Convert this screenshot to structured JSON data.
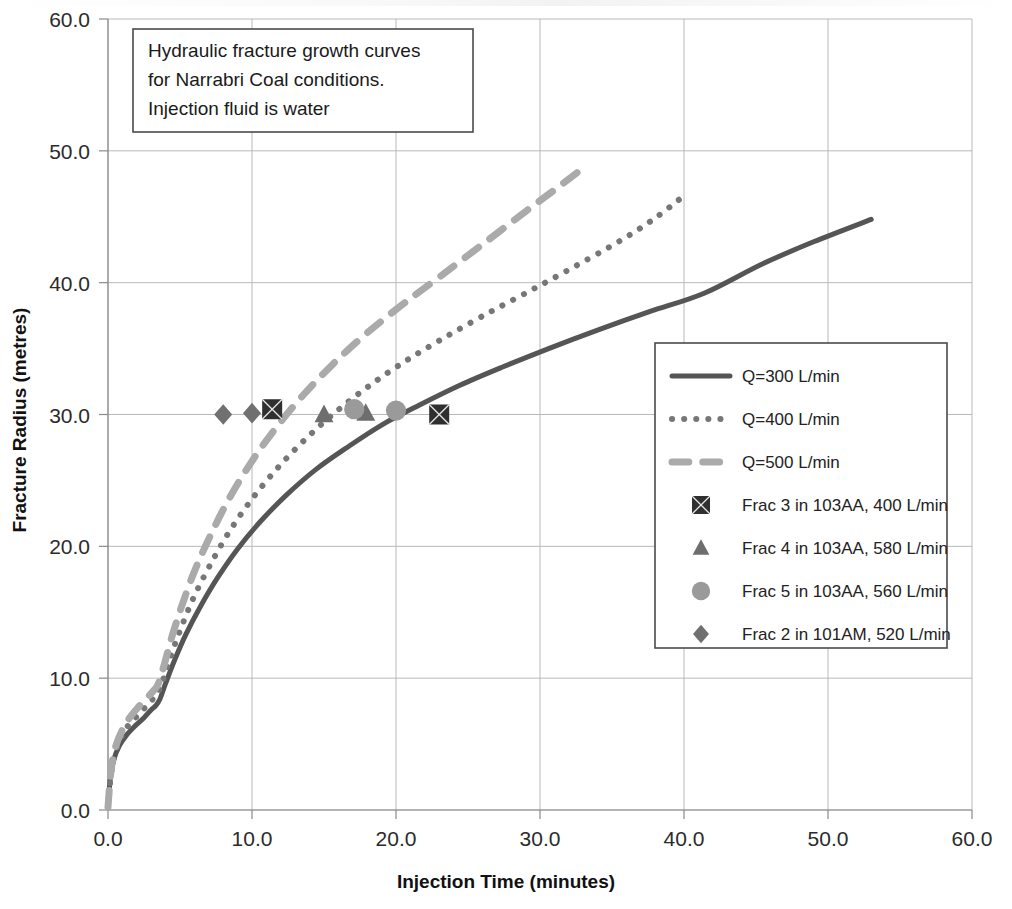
{
  "chart_data": {
    "type": "line",
    "title": "",
    "xlabel": "Injection Time (minutes)",
    "ylabel": "Fracture Radius (metres)",
    "xlim": [
      0,
      60
    ],
    "ylim": [
      0,
      60
    ],
    "xticks": [
      "0.0",
      "10.0",
      "20.0",
      "30.0",
      "40.0",
      "50.0",
      "60.0"
    ],
    "yticks": [
      "0.0",
      "10.0",
      "20.0",
      "30.0",
      "40.0",
      "50.0",
      "60.0"
    ],
    "grid": true,
    "legend_position": "center-right",
    "annotation": {
      "line1": "Hydraulic fracture growth curves",
      "line2": "for Narrabri Coal conditions.",
      "line3": "Injection fluid is  water"
    },
    "series": [
      {
        "name": "Q=300 L/min",
        "style": "solid",
        "color": "#555555",
        "x": [
          0.0,
          0.15,
          0.4,
          0.8,
          1.3,
          1.9,
          2.5,
          3.0,
          3.3,
          3.6,
          4.0,
          4.6,
          5.4,
          6.4,
          7.6,
          9.0,
          10.6,
          12.4,
          14.4,
          16.6,
          19.0,
          21.6,
          24.4,
          27.4,
          30.6,
          34.0,
          37.6,
          41.4,
          45.4,
          49.0,
          53.0
        ],
        "y": [
          0.2,
          2.3,
          3.8,
          4.9,
          5.7,
          6.4,
          7.0,
          7.6,
          7.9,
          8.4,
          9.6,
          11.3,
          13.3,
          15.4,
          17.6,
          19.8,
          21.9,
          23.9,
          25.8,
          27.5,
          29.2,
          30.7,
          32.2,
          33.6,
          35.0,
          36.4,
          37.8,
          39.2,
          41.4,
          43.1,
          44.8
        ]
      },
      {
        "name": "Q=400 L/min",
        "style": "dotted",
        "color": "#777777",
        "x": [
          0.0,
          0.2,
          0.5,
          0.9,
          1.4,
          2.0,
          2.6,
          3.1,
          3.4,
          3.8,
          4.3,
          5.0,
          5.9,
          7.0,
          8.3,
          9.8,
          11.5,
          13.4,
          15.5,
          17.8,
          20.3,
          23.0,
          25.9,
          29.0,
          32.2,
          35.6,
          38.0,
          40.0
        ],
        "y": [
          0.2,
          2.6,
          4.3,
          5.5,
          6.4,
          7.1,
          7.8,
          8.4,
          8.8,
          9.8,
          11.5,
          13.6,
          16.0,
          18.4,
          20.9,
          23.3,
          25.6,
          27.8,
          29.9,
          31.9,
          33.8,
          35.6,
          37.4,
          39.2,
          41.1,
          43.2,
          44.9,
          46.6
        ]
      },
      {
        "name": "Q=500 L/min",
        "style": "dashed",
        "color": "#aaaaaa",
        "x": [
          0.0,
          0.2,
          0.5,
          1.0,
          1.5,
          2.1,
          2.7,
          3.2,
          3.5,
          3.9,
          4.4,
          5.1,
          6.0,
          7.1,
          8.4,
          9.9,
          11.6,
          13.5,
          15.6,
          17.9,
          20.4,
          23.1,
          26.0,
          29.0,
          31.2,
          33.0
        ],
        "y": [
          0.2,
          2.9,
          4.7,
          6.1,
          7.0,
          7.8,
          8.5,
          9.1,
          9.6,
          11.0,
          13.0,
          15.4,
          18.1,
          20.8,
          23.6,
          26.3,
          28.9,
          31.4,
          33.8,
          36.1,
          38.3,
          40.5,
          42.9,
          45.4,
          47.2,
          48.7
        ]
      }
    ],
    "markers": [
      {
        "name": "Frac 3 in 103AA, 400 L/min",
        "shape": "square",
        "color": "#2f2f2f",
        "points": [
          [
            11.4,
            30.4
          ],
          [
            23.0,
            30.0
          ]
        ]
      },
      {
        "name": "Frac 4 in 103AA, 580 L/min",
        "shape": "triangle",
        "color": "#6e6e6e",
        "points": [
          [
            15.0,
            30.0
          ],
          [
            17.9,
            30.1
          ]
        ]
      },
      {
        "name": "Frac 5 in 103AA, 560 L/min",
        "shape": "circle",
        "color": "#9a9a9a",
        "points": [
          [
            17.1,
            30.4
          ],
          [
            20.0,
            30.3
          ]
        ]
      },
      {
        "name": "Frac 2 in 101AM, 520 L/min",
        "shape": "diamond",
        "color": "#707070",
        "points": [
          [
            8.0,
            30.0
          ],
          [
            10.0,
            30.1
          ]
        ]
      }
    ],
    "legend_entries": [
      {
        "label": "Q=300 L/min",
        "kind": "line",
        "style": "solid",
        "color": "#555555"
      },
      {
        "label": "Q=400 L/min",
        "kind": "line",
        "style": "dotted",
        "color": "#777777"
      },
      {
        "label": "Q=500 L/min",
        "kind": "line",
        "style": "dashed",
        "color": "#aaaaaa"
      },
      {
        "label": "Frac 3 in 103AA, 400 L/min",
        "kind": "marker",
        "shape": "square",
        "color": "#2f2f2f"
      },
      {
        "label": "Frac 4 in 103AA, 580 L/min",
        "kind": "marker",
        "shape": "triangle",
        "color": "#6e6e6e"
      },
      {
        "label": "Frac 5 in 103AA, 560 L/min",
        "kind": "marker",
        "shape": "circle",
        "color": "#9a9a9a"
      },
      {
        "label": "Frac 2 in 101AM, 520 L/min",
        "kind": "marker",
        "shape": "diamond",
        "color": "#707070"
      }
    ]
  }
}
